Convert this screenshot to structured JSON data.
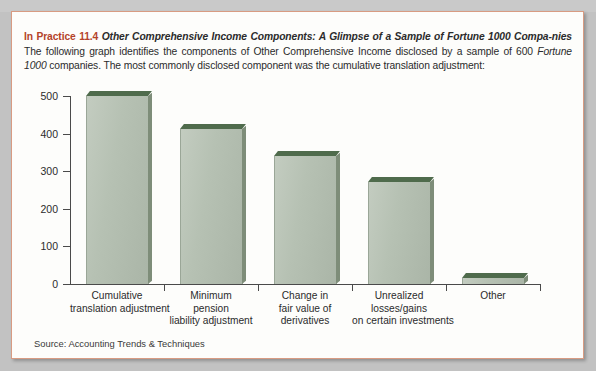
{
  "callout": {
    "kicker": "In Practice 11.4",
    "title": "Other Comprehensive Income Components: A Glimpse of a Sample of Fortune 1000 Compa-nies",
    "title_part1": "Other Comprehensive Income Components: A Glimpse of a Sample of Fortune 1000 Compa-",
    "title_part2": "nies",
    "body_part1": "The following graph identifies the components of Other Comprehensive Income disclosed by a sample of 600 ",
    "body_emphasis": "Fortune 1000",
    "body_part2": " companies. The most commonly disclosed component was the cumulative translation adjustment:"
  },
  "source_note": "Source: Accounting Trends & Techniques",
  "colors": {
    "kicker": "#b4432a",
    "frame_border": "#d89b82",
    "bar_face": "#b6c1b3",
    "bar_top": "#4f6b4c",
    "bar_side": "#7e8d79",
    "axis": "#4a4a4a",
    "panel_background": "#fdfdfb"
  },
  "chart_data": {
    "type": "bar",
    "title": "",
    "xlabel": "",
    "ylabel": "",
    "ylim": [
      0,
      500
    ],
    "yticks": [
      0,
      100,
      200,
      300,
      400,
      500
    ],
    "ytick_labels": [
      "0",
      "100",
      "200",
      "300",
      "400",
      "500"
    ],
    "grid": false,
    "legend": "none",
    "categories": [
      "Cumulative translation adjustment",
      "Minimum pension liability adjustment",
      "Change in fair value of derivatives",
      "Unrealized losses/gains on certain investments",
      "Other"
    ],
    "category_lines": [
      [
        "Cumulative",
        "translation adjustment"
      ],
      [
        "Minimum",
        "pension",
        "liability adjustment"
      ],
      [
        "Change in",
        "fair value of",
        "derivatives"
      ],
      [
        "Unrealized",
        "losses/gains",
        "on certain investments"
      ],
      [
        "Other"
      ]
    ],
    "values": [
      500,
      412,
      340,
      270,
      15
    ],
    "source": "Accounting Trends & Techniques"
  }
}
